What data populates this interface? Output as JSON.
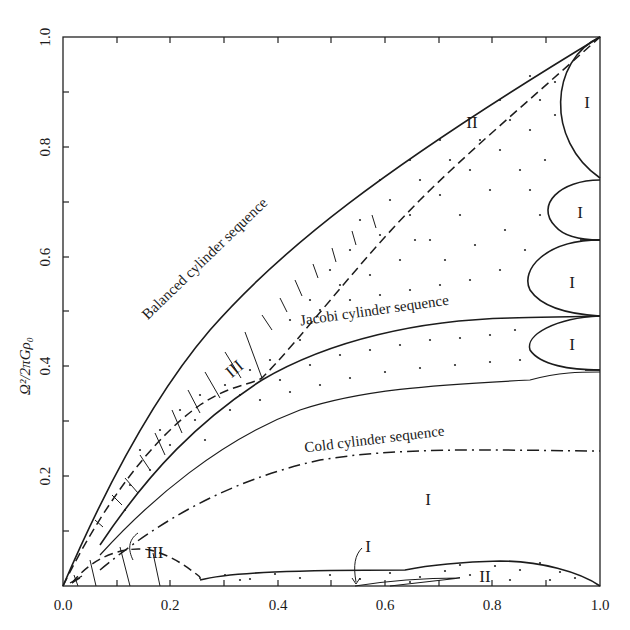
{
  "figure": {
    "type": "stability-diagram",
    "y_axis_title": "Ω²/2πGρ₀",
    "x_ticks": [
      "0.0",
      "0.2",
      "0.4",
      "0.6",
      "0.8",
      "1.0"
    ],
    "y_ticks": [
      "0.2",
      "0.4",
      "0.6",
      "0.8",
      "1.0"
    ],
    "x_range": [
      0.0,
      1.0
    ],
    "y_range": [
      0.0,
      1.0
    ],
    "sequences": {
      "balanced": "Balanced cylinder sequence",
      "jacobi": "Jacobi cylinder sequence",
      "cold": "Cold cylinder sequence"
    },
    "regions": {
      "ii_upper": "II",
      "iii_upper": "III",
      "i_mid": "I",
      "i_right_1": "I",
      "i_right_2": "I",
      "i_right_3": "I",
      "i_right_4": "I",
      "iii_lower": "III",
      "i_lower": "I",
      "ii_lower": "II"
    },
    "colors": {
      "ink": "#1c1c1c",
      "background": "#ffffff"
    }
  }
}
